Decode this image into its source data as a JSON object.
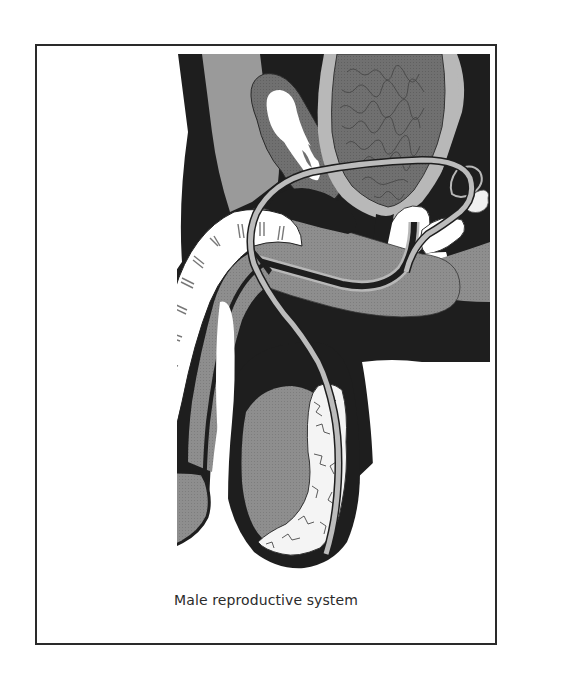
{
  "figure": {
    "caption": "Male reproductive system",
    "illustration_label": "Male reproductive system cross-section illustration",
    "colors": {
      "black": "#1c1c1c",
      "dark_gray": "#6e6e6e",
      "mid_gray": "#8f8f8f",
      "light_gray": "#b8b8b8",
      "white": "#ffffff",
      "border": "#2a2a2a",
      "caption_text": "#2b2b2b"
    },
    "parts": [
      "bladder",
      "vas-deferens",
      "seminal-vesicle",
      "prostate",
      "urethra",
      "corpus-cavernosum",
      "corpus-spongiosum",
      "glans",
      "testis",
      "epididymis",
      "rectum",
      "scrotum"
    ]
  }
}
